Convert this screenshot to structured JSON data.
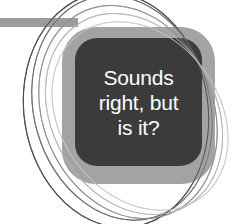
{
  "graphic": {
    "kind": "decorative-callout-badge",
    "text_lines": [
      "Sounds",
      "right, but",
      "is it?"
    ],
    "full_text": "Sounds right, but is it?",
    "colors": {
      "background": "#ffffff",
      "outer_square": "#a3a3a3",
      "inner_square": "#3b3b3b",
      "text": "#ffffff",
      "top_bar": "#9c9c9c",
      "curve_dark": "#4a4a4a",
      "curve_light": "#c8c8c8"
    },
    "decorations": {
      "top_bar_label": "horizontal-gray-bar",
      "ellipse_outlines_count": 5,
      "ellipse_outline_label": "thin-oval-outline"
    }
  }
}
